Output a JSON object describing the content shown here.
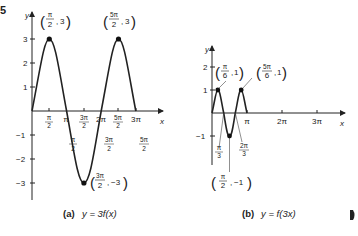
{
  "figure_number_fragment": "5",
  "graph_a": {
    "caption_letter": "(a)",
    "caption_eq": "y = 3f(x)",
    "axis_x": "x",
    "axis_y": "y",
    "y_ticks": [
      "3",
      "2",
      "1",
      "−1",
      "−2",
      "−3"
    ],
    "x_ticks_above": [
      {
        "num": "π",
        "den": "2"
      },
      {
        "num": "π",
        "den": ""
      },
      {
        "num": "3π",
        "den": "2"
      },
      {
        "num": "2π",
        "den": ""
      },
      {
        "num": "5π",
        "den": "2"
      },
      {
        "num": "3π",
        "den": ""
      }
    ],
    "x_labels_below": [
      {
        "num": "π",
        "den": "2"
      },
      {
        "num": "3π",
        "den": "2"
      },
      {
        "num": "5π",
        "den": "2"
      }
    ],
    "points": [
      {
        "label_num": "π",
        "label_den": "2",
        "value": "3"
      },
      {
        "label_num": "5π",
        "label_den": "2",
        "value": "3"
      },
      {
        "label_num": "3π",
        "label_den": "2",
        "value": "−3"
      }
    ]
  },
  "graph_b": {
    "caption_letter": "(b)",
    "caption_eq": "y = f(3x)",
    "axis_x": "x",
    "axis_y": "y",
    "y_ticks": [
      "2",
      "1",
      "−1"
    ],
    "x_ticks": [
      "π",
      "2π",
      "3π"
    ],
    "x_labels_below": [
      {
        "num": "π",
        "den": "3"
      },
      {
        "num": "2π",
        "den": "3"
      }
    ],
    "points": [
      {
        "label_num": "π",
        "label_den": "6",
        "value": "1"
      },
      {
        "label_num": "5π",
        "label_den": "6",
        "value": "1"
      },
      {
        "label_num": "π",
        "label_den": "2",
        "value": "−1"
      }
    ]
  },
  "page_marker": "◗"
}
